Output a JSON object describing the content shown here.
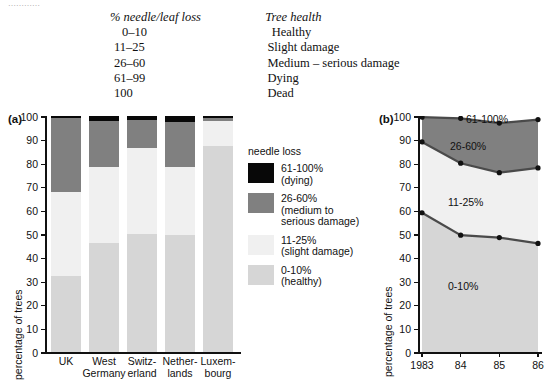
{
  "top_fragment": "…………",
  "key_table": {
    "headers": [
      "% needle/leaf loss",
      "Tree health"
    ],
    "rows": [
      {
        "loss": "0–10",
        "health": "Healthy"
      },
      {
        "loss": "11–25",
        "health": "Slight damage"
      },
      {
        "loss": "26–60",
        "health": "Medium – serious damage"
      },
      {
        "loss": "61–99",
        "health": "Dying"
      },
      {
        "loss": "100",
        "health": "Dead"
      }
    ]
  },
  "panel_a": {
    "tag": "(a)",
    "ylabel": "percentage of trees",
    "yticks": [
      "0",
      "10",
      "20",
      "30",
      "40",
      "50",
      "60",
      "70",
      "80",
      "90",
      "100"
    ]
  },
  "panel_b": {
    "tag": "(b)",
    "ylabel": "percentage of trees",
    "yticks": [
      "0",
      "10",
      "20",
      "30",
      "40",
      "50",
      "60",
      "70",
      "80",
      "90",
      "100"
    ],
    "xticks": [
      "1983",
      "84",
      "85",
      "86"
    ],
    "area_labels": [
      "61-100%",
      "26-60%",
      "11-25%",
      "0-10%"
    ]
  },
  "legend": {
    "title": "needle loss",
    "items": [
      {
        "swatch": "#080808",
        "line1": "61-100%",
        "line2": "(dying)",
        "line3": ""
      },
      {
        "swatch": "#808080",
        "line1": "26-60%",
        "line2": "(medium to",
        "line3": "serious damage)"
      },
      {
        "swatch": "#f0f0f0",
        "line1": "11-25%",
        "line2": "(slight damage)",
        "line3": ""
      },
      {
        "swatch": "#d6d6d6",
        "line1": "0-10%",
        "line2": "(healthy)",
        "line3": ""
      }
    ]
  },
  "colors": {
    "dying": "#080808",
    "medium": "#808080",
    "slight": "#f0f0f0",
    "healthy": "#d6d6d6",
    "axis": "#111111",
    "background": "#ffffff"
  },
  "chart_data": [
    {
      "type": "bar",
      "id": "panel-a",
      "title": "(a)",
      "stacked": true,
      "xlabel": "",
      "ylabel": "percentage of trees",
      "ylim": [
        0,
        100
      ],
      "grid": false,
      "legend_position": "right",
      "categories": [
        "UK",
        "West Germany",
        "Switzerland",
        "Netherlands",
        "Luxembourg"
      ],
      "category_lines": [
        [
          "UK"
        ],
        [
          "West",
          "Germany"
        ],
        [
          "Switz-",
          "erland"
        ],
        [
          "Nether-",
          "lands"
        ],
        [
          "Luxem-",
          "bourg"
        ]
      ],
      "series": [
        {
          "name": "0-10% (healthy)",
          "color": "#d6d6d6",
          "values": [
            32,
            46,
            50,
            49.5,
            87.5
          ]
        },
        {
          "name": "11-25% (slight damage)",
          "color": "#f0f0f0",
          "values": [
            36,
            32.5,
            36.5,
            29,
            10.5
          ]
        },
        {
          "name": "26-60% (medium to serious damage)",
          "color": "#808080",
          "values": [
            31,
            19.5,
            12,
            19,
            1
          ]
        },
        {
          "name": "61-100% (dying)",
          "color": "#080808",
          "values": [
            1,
            2,
            1.5,
            2.5,
            1
          ]
        }
      ],
      "cumulative_tops": [
        {
          "category": "UK",
          "healthy": 32,
          "slight": 68,
          "medium": 99,
          "dying": 100
        },
        {
          "category": "West Germany",
          "healthy": 46,
          "slight": 78.5,
          "medium": 98,
          "dying": 100
        },
        {
          "category": "Switzerland",
          "healthy": 50,
          "slight": 86.5,
          "medium": 98.5,
          "dying": 100
        },
        {
          "category": "Netherlands",
          "healthy": 49.5,
          "slight": 78.5,
          "medium": 97.5,
          "dying": 100
        },
        {
          "category": "Luxembourg",
          "healthy": 87.5,
          "slight": 98,
          "medium": 99,
          "dying": 100
        }
      ]
    },
    {
      "type": "area",
      "id": "panel-b",
      "title": "(b)",
      "stacked": true,
      "xlabel": "",
      "ylabel": "percentage of trees",
      "ylim": [
        0,
        100
      ],
      "grid": false,
      "markers": true,
      "x": [
        "1983",
        "84",
        "85",
        "86"
      ],
      "series": [
        {
          "name": "0-10%",
          "color": "#d6d6d6",
          "boundary_top": [
            59,
            49.5,
            48.5,
            46
          ]
        },
        {
          "name": "11-25%",
          "color": "#f0f0f0",
          "boundary_top": [
            89,
            80,
            76,
            78
          ]
        },
        {
          "name": "26-60%",
          "color": "#808080",
          "boundary_top": [
            99.5,
            99,
            97,
            98.5
          ]
        },
        {
          "name": "61-100%",
          "color": "#ffffff",
          "boundary_top": [
            100,
            100,
            100,
            100
          ]
        }
      ],
      "annotations": [
        {
          "text": "61-100%",
          "x": "84.6",
          "y": "101"
        },
        {
          "text": "26-60%",
          "x": "84.2",
          "y": "88"
        },
        {
          "text": "11-25%",
          "x": "84.4",
          "y": "63"
        },
        {
          "text": "0-10%",
          "x": "84.4",
          "y": "27"
        }
      ]
    }
  ]
}
